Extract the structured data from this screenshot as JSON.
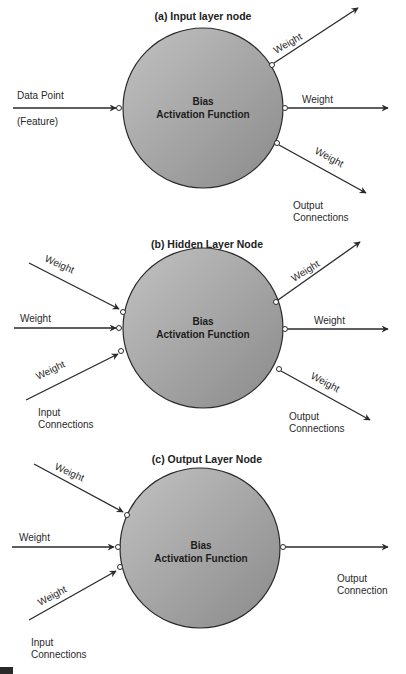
{
  "diagram": {
    "colors": {
      "node_fill_light": "#b4b4b4",
      "node_fill_dark": "#8a8a8a",
      "line": "#2a2a2a",
      "background": "#ffffff"
    },
    "center_text": {
      "line1": "Bias",
      "line2": "Activation Function"
    },
    "panels": [
      {
        "title": "(a) Input layer node",
        "input_label_top": "Data Point",
        "input_label_bottom": "(Feature)",
        "outputs": [
          "Weight",
          "Weight",
          "Weight"
        ],
        "output_group_label_1": "Output",
        "output_group_label_2": "Connections"
      },
      {
        "title": "(b) Hidden Layer Node",
        "inputs": [
          "Weight",
          "Weight",
          "Weight"
        ],
        "input_group_label_1": "Input",
        "input_group_label_2": "Connections",
        "outputs": [
          "Weight",
          "Weight",
          "Weight"
        ],
        "output_group_label_1": "Output",
        "output_group_label_2": "Connections"
      },
      {
        "title": "(c) Output Layer Node",
        "inputs": [
          "Weight",
          "Weight",
          "Weight"
        ],
        "input_group_label_1": "Input",
        "input_group_label_2": "Connections",
        "output_group_label_1": "Output",
        "output_group_label_2": "Connection"
      }
    ]
  }
}
